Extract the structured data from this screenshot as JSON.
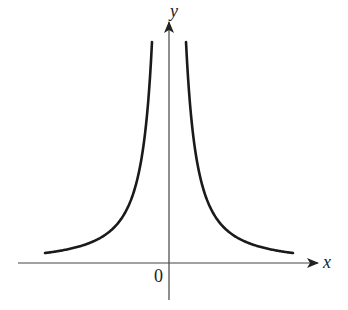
{
  "figure": {
    "axes": {
      "x_label": "x",
      "y_label": "y",
      "origin_label": "0"
    },
    "curve": {
      "shape": "y = 1/x^2",
      "branches": [
        "left",
        "right"
      ],
      "color": "#1a1a1a"
    },
    "axis_color": "#444444"
  }
}
